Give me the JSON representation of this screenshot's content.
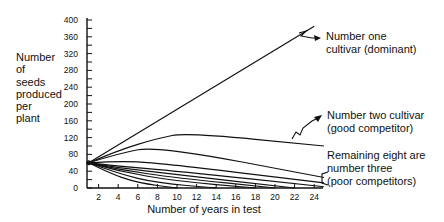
{
  "chart_data": {
    "type": "line",
    "title": "",
    "xlabel": "Number of years in test",
    "ylabel": "Number of seeds produced per plant",
    "ylabel_lines": [
      "Number",
      "of",
      "seeds",
      "produced",
      "per",
      "plant"
    ],
    "xlim": [
      0,
      25
    ],
    "ylim": [
      0,
      400
    ],
    "x_ticks": [
      2,
      4,
      6,
      8,
      10,
      12,
      14,
      16,
      18,
      20,
      22,
      24
    ],
    "y_ticks": [
      0,
      40,
      80,
      120,
      160,
      200,
      240,
      280,
      320,
      360,
      400
    ],
    "grid": false,
    "legend": "none (inline annotations)",
    "series": [
      {
        "name": "Number one cultivar (dominant)",
        "x": [
          1,
          24
        ],
        "values": [
          60,
          385
        ]
      },
      {
        "name": "Number two cultivar (good competitor)",
        "x": [
          1,
          4,
          8,
          11,
          25
        ],
        "values": [
          60,
          90,
          118,
          132,
          100
        ]
      },
      {
        "name": "Number three cultivar 1",
        "x": [
          1,
          4,
          8,
          25
        ],
        "values": [
          60,
          82,
          100,
          25
        ]
      },
      {
        "name": "Number three cultivar 2",
        "x": [
          1,
          4,
          8,
          25
        ],
        "values": [
          60,
          64,
          60,
          12
        ]
      },
      {
        "name": "Number three cultivar 3",
        "x": [
          1,
          4,
          10,
          25
        ],
        "values": [
          60,
          52,
          40,
          3
        ]
      },
      {
        "name": "Number three cultivar 4",
        "x": [
          1,
          4,
          10,
          22
        ],
        "values": [
          60,
          48,
          32,
          0
        ]
      },
      {
        "name": "Number three cultivar 5",
        "x": [
          1,
          4,
          10,
          20
        ],
        "values": [
          60,
          44,
          24,
          0
        ]
      },
      {
        "name": "Number three cultivar 6",
        "x": [
          1,
          4,
          10,
          18
        ],
        "values": [
          60,
          40,
          16,
          0
        ]
      },
      {
        "name": "Number three cultivar 7",
        "x": [
          1,
          4,
          8,
          14
        ],
        "values": [
          60,
          34,
          12,
          0
        ]
      },
      {
        "name": "Number three cultivar 8",
        "x": [
          1,
          3,
          6,
          10
        ],
        "values": [
          60,
          36,
          12,
          0
        ]
      }
    ],
    "annotations": [
      {
        "text": "Number one cultivar (dominant)",
        "lines": [
          "Number  one",
          "cultivar  (dominant)"
        ]
      },
      {
        "text": "Number two cultivar (good competitor)",
        "lines": [
          "Number  two  cultivar",
          "(good  competitor)"
        ]
      },
      {
        "text": "Remaining eight are number three (poor competitors)",
        "lines": [
          "Remaining  eight  are",
          "number  three",
          "(poor  competitors)"
        ]
      }
    ]
  }
}
